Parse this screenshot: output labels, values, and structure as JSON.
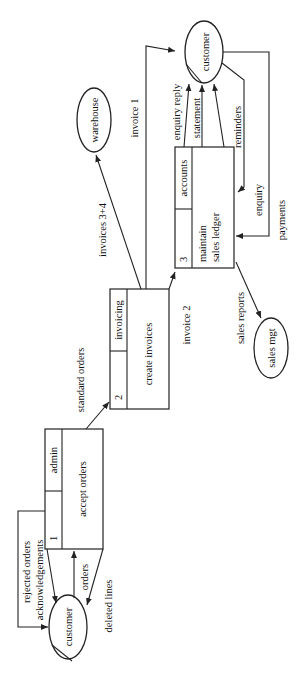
{
  "diagram": {
    "type": "data-flow-diagram",
    "orientation": "rotated-90-ccw",
    "processes": [
      {
        "id": "1",
        "number": "1",
        "location": "admin",
        "name": "accept orders"
      },
      {
        "id": "2",
        "number": "2",
        "location": "invoicing",
        "name": "create invoices"
      },
      {
        "id": "3",
        "number": "3",
        "location": "accounts",
        "name_line1": "maintain",
        "name_line2": "sales ledger"
      }
    ],
    "externals": {
      "customer_left": "customer",
      "customer_right": "customer",
      "warehouse": "warehouse",
      "sales_mgt": "sales mgt"
    },
    "flows": {
      "rejected_orders": "rejected orders",
      "acknowledgements": "acknowledgements",
      "orders": "orders",
      "deleted_lines": "deleted lines",
      "standard_orders": "standard orders",
      "invoices_3_4": "invoices 3+4",
      "invoice_1": "invoice 1",
      "invoice_2": "invoice 2",
      "enquiry_reply": "enquiry reply",
      "statement": "statement",
      "reminders": "reminders",
      "enquiry": "enquiry",
      "payments": "payments",
      "sales_reports": "sales reports"
    }
  }
}
